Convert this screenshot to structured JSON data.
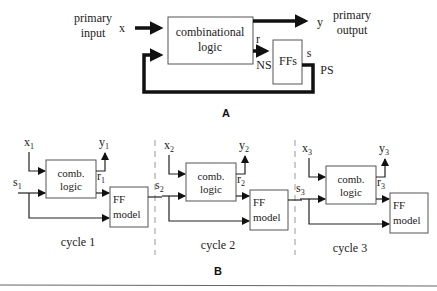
{
  "figure_a": {
    "label": "A",
    "primary_input_line1": "primary",
    "primary_input_line2": "input",
    "input_signal": "x",
    "comb_logic_line1": "combinational",
    "comb_logic_line2": "logic",
    "output_signal": "y",
    "primary_output_line1": "primary",
    "primary_output_line2": "output",
    "next_state_signal": "r",
    "next_state_label": "NS",
    "ff_block": "FFs",
    "present_state_signal": "s",
    "present_state_label": "PS"
  },
  "figure_b": {
    "label": "B",
    "cycles": [
      {
        "input": "x",
        "input_sub": "1",
        "output": "y",
        "output_sub": "1",
        "state": "s",
        "state_sub": "1",
        "next": "r",
        "next_sub": "1",
        "comb_line1": "comb.",
        "comb_line2": "logic",
        "ff_line1": "FF",
        "ff_line2": "model",
        "caption": "cycle 1"
      },
      {
        "input": "x",
        "input_sub": "2",
        "output": "y",
        "output_sub": "2",
        "state": "s",
        "state_sub": "2",
        "next": "r",
        "next_sub": "2",
        "comb_line1": "comb.",
        "comb_line2": "logic",
        "ff_line1": "FF",
        "ff_line2": "model",
        "caption": "cycle 2"
      },
      {
        "input": "x",
        "input_sub": "3",
        "output": "y",
        "output_sub": "3",
        "state": "s",
        "state_sub": "3",
        "next": "r",
        "next_sub": "3",
        "comb_line1": "comb.",
        "comb_line2": "logic",
        "ff_line1": "FF",
        "ff_line2": "model",
        "caption": "cycle 3"
      }
    ]
  }
}
